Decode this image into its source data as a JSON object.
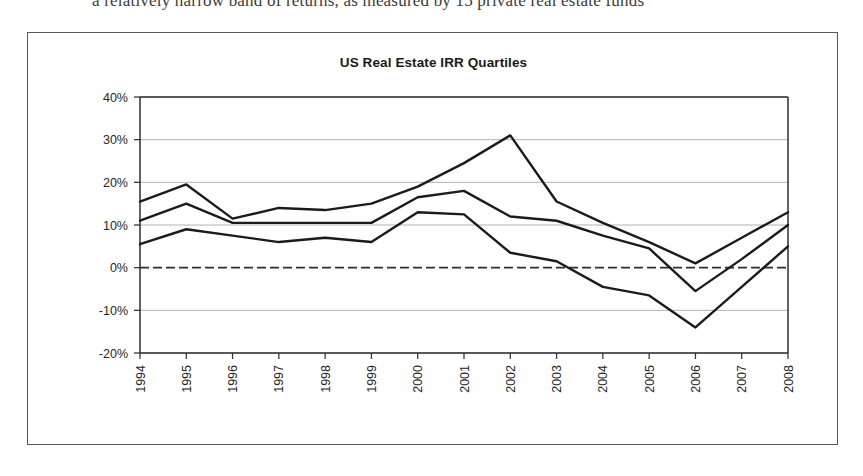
{
  "page": {
    "caption": "a relatively narrow band of returns, as measured by 15 private real estate funds"
  },
  "figure": {
    "title": "US Real Estate IRR Quartiles"
  },
  "chart_data": {
    "type": "line",
    "title": "US Real Estate IRR Quartiles",
    "xlabel": "",
    "ylabel": "",
    "grid": true,
    "legend": "none",
    "ylim": [
      -20,
      40
    ],
    "ytick_labels": [
      "40%",
      "30%",
      "20%",
      "10%",
      "0%",
      "-10%",
      "-20%"
    ],
    "ytick_values": [
      40,
      30,
      20,
      10,
      0,
      -10,
      -20
    ],
    "categories": [
      "1994",
      "1995",
      "1996",
      "1997",
      "1998",
      "1999",
      "2000",
      "2001",
      "2002",
      "2003",
      "2004",
      "2005",
      "2006",
      "2007",
      "2008"
    ],
    "x": [
      1994,
      1995,
      1996,
      1997,
      1998,
      1999,
      2000,
      2001,
      2002,
      2003,
      2004,
      2005,
      2006,
      2007,
      2008
    ],
    "zero_line": 0,
    "series": [
      {
        "name": "Upper Quartile",
        "values": [
          15.5,
          19.5,
          11.5,
          14,
          13.5,
          15,
          19,
          24.5,
          31,
          15.5,
          10.5,
          6,
          1,
          7,
          13
        ]
      },
      {
        "name": "Median",
        "values": [
          11,
          15,
          10.5,
          10.5,
          10.5,
          10.5,
          16.5,
          18,
          12,
          11,
          7.5,
          4.5,
          -5.5,
          2,
          10
        ]
      },
      {
        "name": "Lower Quartile",
        "values": [
          5.5,
          9,
          7.5,
          6,
          7,
          6,
          13,
          12.5,
          3.5,
          1.5,
          -4.5,
          -6.5,
          -14,
          -4.5,
          5
        ]
      }
    ]
  }
}
